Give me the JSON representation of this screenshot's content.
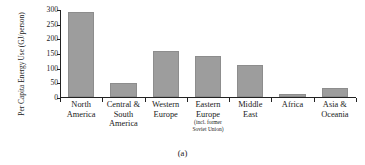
{
  "chart_data": {
    "type": "bar",
    "title": "",
    "xlabel": "",
    "ylabel_lines": [
      "Per Capita Energy",
      "Use (GJ/person)"
    ],
    "ylabel": "Per Capita Energy Use (GJ/person)",
    "ylim": [
      0,
      300
    ],
    "yticks": [
      0,
      50,
      100,
      150,
      200,
      250,
      300
    ],
    "ytick_labels": [
      "0",
      "50",
      "100",
      "150",
      "200",
      "250",
      "300"
    ],
    "grid": false,
    "legend": "none",
    "bar_color": "#9d9d9d",
    "axis_color": "#222222",
    "categories": [
      "North America",
      "Central & South America",
      "Western Europe",
      "Eastern Europe (incl. former Soviet Union)",
      "Middle East",
      "Africa",
      "Asia & Oceania"
    ],
    "category_lines": [
      [
        "North",
        "America"
      ],
      [
        "Central &",
        "South",
        "America"
      ],
      [
        "Western",
        "Europe"
      ],
      [
        "Eastern",
        "Europe"
      ],
      [
        "Middle",
        "East"
      ],
      [
        "Africa"
      ],
      [
        "Asia &",
        "Oceania"
      ]
    ],
    "category_sublines": [
      [],
      [],
      [],
      [
        "(incl. former",
        "Soviet Union)"
      ],
      [],
      [],
      []
    ],
    "values": [
      293,
      48,
      157,
      140,
      110,
      12,
      30
    ]
  },
  "caption": "(a)"
}
